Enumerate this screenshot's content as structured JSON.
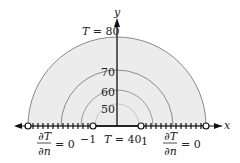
{
  "axes": {
    "x_label": "x",
    "y_label": "y"
  },
  "isotherms": [
    {
      "label": "T = 80",
      "value": 80,
      "radius_px": 89
    },
    {
      "label": "70",
      "value": 70,
      "radius_px": 56
    },
    {
      "label": "60",
      "value": 60,
      "radius_px": 36
    },
    {
      "label": "50",
      "value": 50,
      "radius_px": 22
    }
  ],
  "boundary_labels": {
    "left_bc": {
      "numerator": "∂T",
      "denominator": "∂n",
      "rhs": "= 0"
    },
    "right_bc": {
      "numerator": "∂T",
      "denominator": "∂n",
      "rhs": "= 0"
    },
    "center": "T = 40",
    "tick_minus_one": "−1",
    "tick_one": "1"
  },
  "colors": {
    "fill": "#ececec",
    "arc": "#8a8a8a",
    "axis": "#111111"
  }
}
